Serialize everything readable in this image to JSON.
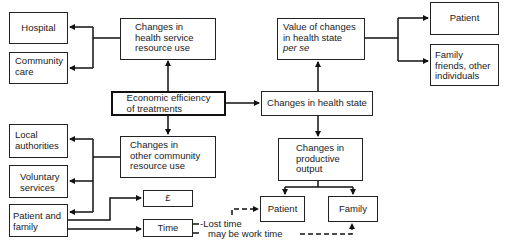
{
  "diagram": {
    "center": {
      "label_line1": "Economic efficiency",
      "label_line2": "of treatments"
    },
    "health_service": {
      "label_line1": "Changes in",
      "label_line2": "health service",
      "label_line3": "resource use"
    },
    "hospital": {
      "label": "Hospital"
    },
    "community_care": {
      "label_line1": "Community",
      "label_line2": "care"
    },
    "other_community": {
      "label_line1": "Changes in",
      "label_line2": "other community",
      "label_line3": "resource use"
    },
    "local_authorities": {
      "label_line1": "Local",
      "label_line2": "authorities"
    },
    "voluntary_services": {
      "label_line1": "Voluntary",
      "label_line2": "services"
    },
    "patient_family": {
      "label_line1": "Patient and",
      "label_line2": "family"
    },
    "money": {
      "label": "£"
    },
    "time": {
      "label": "Time"
    },
    "health_state": {
      "label": "Changes in health state"
    },
    "value_changes": {
      "label_line1": "Value of changes",
      "label_line2": "in health state",
      "label_line3": "per se"
    },
    "value_patient": {
      "label": "Patient"
    },
    "value_family": {
      "label_line1": "Family",
      "label_line2": "friends, other",
      "label_line3": "individuals"
    },
    "productive_output": {
      "label_line1": "Changes in",
      "label_line2": "productive",
      "label_line3": "output"
    },
    "output_patient": {
      "label": "Patient"
    },
    "output_family": {
      "label": "Family"
    },
    "annotations": {
      "lost_time": "-Lost time",
      "work_time": "may be work time"
    }
  }
}
